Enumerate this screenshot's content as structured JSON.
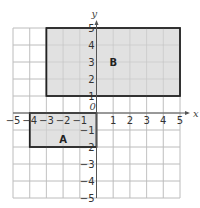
{
  "diagram": {
    "type": "coordinate-grid",
    "x_axis_label": "x",
    "y_axis_label": "y",
    "origin_label": "0",
    "x_range": [
      -5,
      5
    ],
    "y_range": [
      -5,
      5
    ],
    "x_ticks": [
      "−5",
      "−4",
      "−3",
      "−2",
      "−1",
      "1",
      "2",
      "3",
      "4",
      "5"
    ],
    "y_ticks": [
      "5",
      "4",
      "3",
      "2",
      "1",
      "−1",
      "−2",
      "−3",
      "−4",
      "−5"
    ],
    "shapes": [
      {
        "label": "A",
        "type": "rectangle",
        "x_min": -4,
        "x_max": 0,
        "y_min": -2,
        "y_max": 0,
        "fill": "#dcdcdc",
        "stroke": "#222222"
      },
      {
        "label": "B",
        "type": "rectangle",
        "x_min": -3,
        "x_max": 5,
        "y_min": 1,
        "y_max": 5,
        "fill": "#dcdcdc",
        "stroke": "#222222"
      }
    ],
    "grid_color": "#bdbdbd",
    "axis_color": "#555555"
  }
}
